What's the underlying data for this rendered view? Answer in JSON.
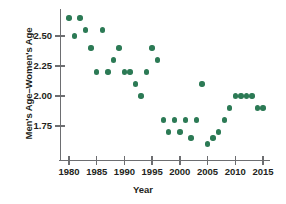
{
  "chart_data": {
    "type": "scatter",
    "title": "",
    "xlabel": "Year",
    "ylabel": "Men's Age–Women's Age",
    "xlim": [
      1978.0,
      2016.5
    ],
    "ylim": [
      1.56,
      2.68
    ],
    "grid": false,
    "legend": null,
    "marker_color": "#2c7a55",
    "axis_color": "#6d6e71",
    "xticks": [
      1980,
      1985,
      1990,
      1995,
      2000,
      2005,
      2010,
      2015
    ],
    "xticklabels": [
      "1980",
      "1985",
      "1990",
      "1995",
      "2000",
      "2005",
      "2010",
      "2015"
    ],
    "yticks": [
      1.75,
      2.0,
      2.25,
      2.5
    ],
    "yticklabels": [
      "1.75",
      "2.00",
      "2.25",
      "2.50"
    ],
    "x": [
      1980,
      1981,
      1982,
      1983,
      1984,
      1985,
      1986,
      1987,
      1988,
      1989,
      1990,
      1991,
      1992,
      1993,
      1994,
      1995,
      1996,
      1997,
      1998,
      1999,
      2000,
      2001,
      2002,
      2003,
      2004,
      2005,
      2006,
      2007,
      2008,
      2009,
      2010,
      2011,
      2012,
      2013,
      2014,
      2015
    ],
    "y": [
      2.65,
      2.5,
      2.65,
      2.55,
      2.4,
      2.2,
      2.55,
      2.2,
      2.3,
      2.4,
      2.2,
      2.2,
      2.1,
      2.0,
      2.2,
      2.4,
      2.3,
      1.8,
      1.7,
      1.8,
      1.7,
      1.8,
      1.65,
      1.8,
      2.1,
      1.6,
      1.65,
      1.7,
      1.8,
      1.9,
      2.0,
      2.0,
      2.0,
      2.0,
      1.9,
      1.9
    ],
    "points": [
      {
        "year": 1980,
        "value": 2.65
      },
      {
        "year": 1981,
        "value": 2.5
      },
      {
        "year": 1982,
        "value": 2.65
      },
      {
        "year": 1983,
        "value": 2.55
      },
      {
        "year": 1984,
        "value": 2.4
      },
      {
        "year": 1985,
        "value": 2.2
      },
      {
        "year": 1986,
        "value": 2.55
      },
      {
        "year": 1987,
        "value": 2.2
      },
      {
        "year": 1988,
        "value": 2.3
      },
      {
        "year": 1989,
        "value": 2.4
      },
      {
        "year": 1990,
        "value": 2.2
      },
      {
        "year": 1991,
        "value": 2.2
      },
      {
        "year": 1992,
        "value": 2.1
      },
      {
        "year": 1993,
        "value": 2.0
      },
      {
        "year": 1994,
        "value": 2.2
      },
      {
        "year": 1995,
        "value": 2.4
      },
      {
        "year": 1996,
        "value": 2.3
      },
      {
        "year": 1997,
        "value": 1.8
      },
      {
        "year": 1998,
        "value": 1.7
      },
      {
        "year": 1999,
        "value": 1.8
      },
      {
        "year": 2000,
        "value": 1.7
      },
      {
        "year": 2001,
        "value": 1.8
      },
      {
        "year": 2002,
        "value": 1.65
      },
      {
        "year": 2003,
        "value": 1.8
      },
      {
        "year": 2004,
        "value": 2.1
      },
      {
        "year": 2005,
        "value": 1.6
      },
      {
        "year": 2006,
        "value": 1.65
      },
      {
        "year": 2007,
        "value": 1.7
      },
      {
        "year": 2008,
        "value": 1.8
      },
      {
        "year": 2009,
        "value": 1.9
      },
      {
        "year": 2010,
        "value": 2.0
      },
      {
        "year": 2011,
        "value": 2.0
      },
      {
        "year": 2012,
        "value": 2.0
      },
      {
        "year": 2013,
        "value": 2.0
      },
      {
        "year": 2014,
        "value": 1.9
      },
      {
        "year": 2015,
        "value": 1.9
      }
    ]
  }
}
